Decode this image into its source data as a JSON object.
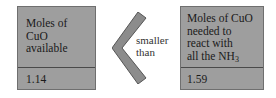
{
  "left_box": {
    "label_lines": [
      "Moles of",
      "CuO",
      "available"
    ],
    "value": "1.14"
  },
  "comparison": {
    "symbol": "less-than-chevron",
    "label_lines": [
      "smaller",
      "than"
    ]
  },
  "right_box": {
    "label_lines": [
      "Moles of CuO",
      "needed to",
      "react with",
      "all the NH"
    ],
    "label_subscript": "3",
    "value": "1.59"
  },
  "colors": {
    "box_fill": "#9e9e9e",
    "box_border": "#6f6f6f",
    "chevron_fill": "#8c8c8c",
    "chevron_stroke": "#555555"
  }
}
